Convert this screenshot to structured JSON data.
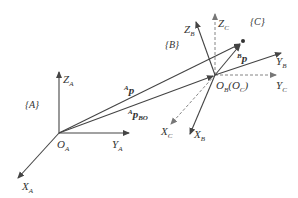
{
  "frames": {
    "A": {
      "label": "{A}",
      "origin": "O",
      "origin_sub": "A",
      "x": "X",
      "x_sub": "A",
      "y": "Y",
      "y_sub": "A",
      "z": "Z",
      "z_sub": "A"
    },
    "B": {
      "label": "{B}",
      "origin": "O",
      "origin_sub": "B",
      "origin_paren": "(O",
      "origin_paren_sub": "C",
      "origin_paren_close": ")",
      "x": "X",
      "x_sub": "B",
      "y": "Y",
      "y_sub": "B",
      "z": "Z",
      "z_sub": "B"
    },
    "C": {
      "label": "{C}",
      "x": "X",
      "x_sub": "C",
      "y": "Y",
      "y_sub": "C",
      "z": "Z",
      "z_sub": "C"
    }
  },
  "vectors": {
    "Ap": {
      "sup": "A",
      "main": "p"
    },
    "ApBO": {
      "sup": "A",
      "main": "p",
      "sub": "BO"
    },
    "Bp": {
      "sup": "B",
      "main": "p"
    }
  },
  "colors": {
    "line": "#444444",
    "dashed": "#777777",
    "text": "#333333"
  }
}
